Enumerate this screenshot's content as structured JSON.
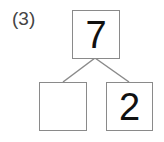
{
  "problem": {
    "label": "(3)",
    "diagram_type": "number-bond",
    "whole": {
      "value": "7"
    },
    "parts": [
      {
        "position": "left",
        "value": ""
      },
      {
        "position": "right",
        "value": "2"
      }
    ]
  },
  "colors": {
    "box_border": "#8a8a8a",
    "connector_line": "#8a8a8a",
    "number_text": "#111111",
    "label_text": "#444444",
    "background": "#ffffff"
  }
}
